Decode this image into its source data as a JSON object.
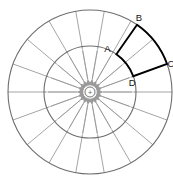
{
  "figure": {
    "background_color": "#ffffff"
  },
  "center_charge": {
    "symbol": "+",
    "name": "point-charge",
    "cx": 90,
    "cy": 92,
    "radius": 5,
    "color": "#777777"
  },
  "circles": {
    "inner": {
      "radius": 46,
      "color": "#6e6e6e",
      "stroke_width": 1.1
    },
    "outer": {
      "radius": 82,
      "color": "#6e6e6e",
      "stroke_width": 1.1
    }
  },
  "spokes": {
    "count": 18,
    "step_degrees": 20,
    "color": "#9a9a9a",
    "stroke_width": 0.9,
    "angles": [
      0,
      20,
      40,
      60,
      80,
      100,
      120,
      140,
      160,
      180,
      200,
      220,
      240,
      260,
      280,
      300,
      320,
      340
    ]
  },
  "field_arrows": {
    "direction": "inward",
    "count": 18,
    "color": "#9a9a9a",
    "stroke_width": 1.0,
    "head_size": 3.2,
    "tail_radius": 42,
    "tip_radius": 13,
    "angles": [
      0,
      20,
      40,
      60,
      80,
      100,
      120,
      140,
      160,
      180,
      200,
      220,
      240,
      260,
      280,
      300,
      320,
      340
    ]
  },
  "sector": {
    "name": "highlighted-sector",
    "color": "#000000",
    "stroke_width": 1.9,
    "start_angle_degrees": 20,
    "end_angle_degrees": 55,
    "inner_radius": 46,
    "outer_radius": 82,
    "vertices": [
      {
        "label": "A",
        "position": "inner-upper",
        "radius": 46,
        "angle_degrees": 55,
        "label_dx": -9,
        "label_dy": -2
      },
      {
        "label": "B",
        "position": "outer-upper",
        "radius": 82,
        "angle_degrees": 55,
        "label_dx": 2,
        "label_dy": -4
      },
      {
        "label": "C",
        "position": "outer-lower",
        "radius": 82,
        "angle_degrees": 20,
        "label_dx": 4,
        "label_dy": 3
      },
      {
        "label": "D",
        "position": "inner-lower",
        "radius": 46,
        "angle_degrees": 20,
        "label_dx": -1,
        "label_dy": 10
      }
    ]
  },
  "labels": {
    "A": "A",
    "B": "B",
    "C": "C",
    "D": "D"
  }
}
